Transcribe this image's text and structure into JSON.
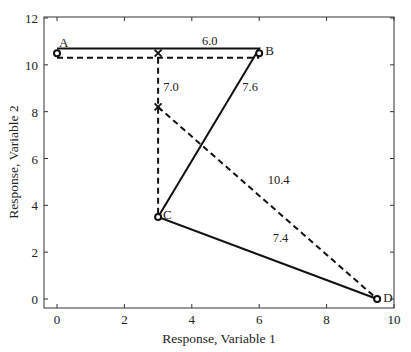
{
  "chart_data": {
    "type": "line",
    "title": "",
    "xlabel": "Response, Variable 1",
    "ylabel": "Response, Variable 2",
    "xlim": [
      -0.4,
      10
    ],
    "ylim": [
      -0.4,
      12
    ],
    "xticks": [
      0,
      2,
      4,
      6,
      8,
      10
    ],
    "yticks": [
      0,
      2,
      4,
      6,
      8,
      10,
      12
    ],
    "grid": false,
    "points": [
      {
        "name": "A",
        "x": 0,
        "y": 10.5
      },
      {
        "name": "B",
        "x": 6,
        "y": 10.5
      },
      {
        "name": "C",
        "x": 3,
        "y": 3.5
      },
      {
        "name": "D",
        "x": 9.5,
        "y": 0
      }
    ],
    "series": [
      {
        "name": "solid-path",
        "style": "solid",
        "x": [
          0,
          6,
          3,
          9.5
        ],
        "y": [
          10.7,
          10.7,
          3.5,
          0
        ]
      },
      {
        "name": "dashed-path",
        "style": "dashed",
        "x": [
          0,
          6
        ],
        "y": [
          10.3,
          10.3
        ]
      },
      {
        "name": "dashed-vertical",
        "style": "dashed",
        "x": [
          3,
          3
        ],
        "y": [
          10.3,
          3.5
        ]
      },
      {
        "name": "dashed-diagonal",
        "style": "dashed",
        "x": [
          3,
          9.5
        ],
        "y": [
          8.2,
          0
        ]
      }
    ],
    "markers_x": [
      {
        "x": 3,
        "y": 10.5
      },
      {
        "x": 3,
        "y": 8.2
      }
    ],
    "annotations": [
      {
        "text": "6.0",
        "x": 4.3,
        "y": 10.85
      },
      {
        "text": "7.0",
        "x": 3.15,
        "y": 8.9
      },
      {
        "text": "7.6",
        "x": 5.5,
        "y": 8.9
      },
      {
        "text": "10.4",
        "x": 6.25,
        "y": 4.9
      },
      {
        "text": "7.4",
        "x": 6.4,
        "y": 2.45
      }
    ]
  }
}
